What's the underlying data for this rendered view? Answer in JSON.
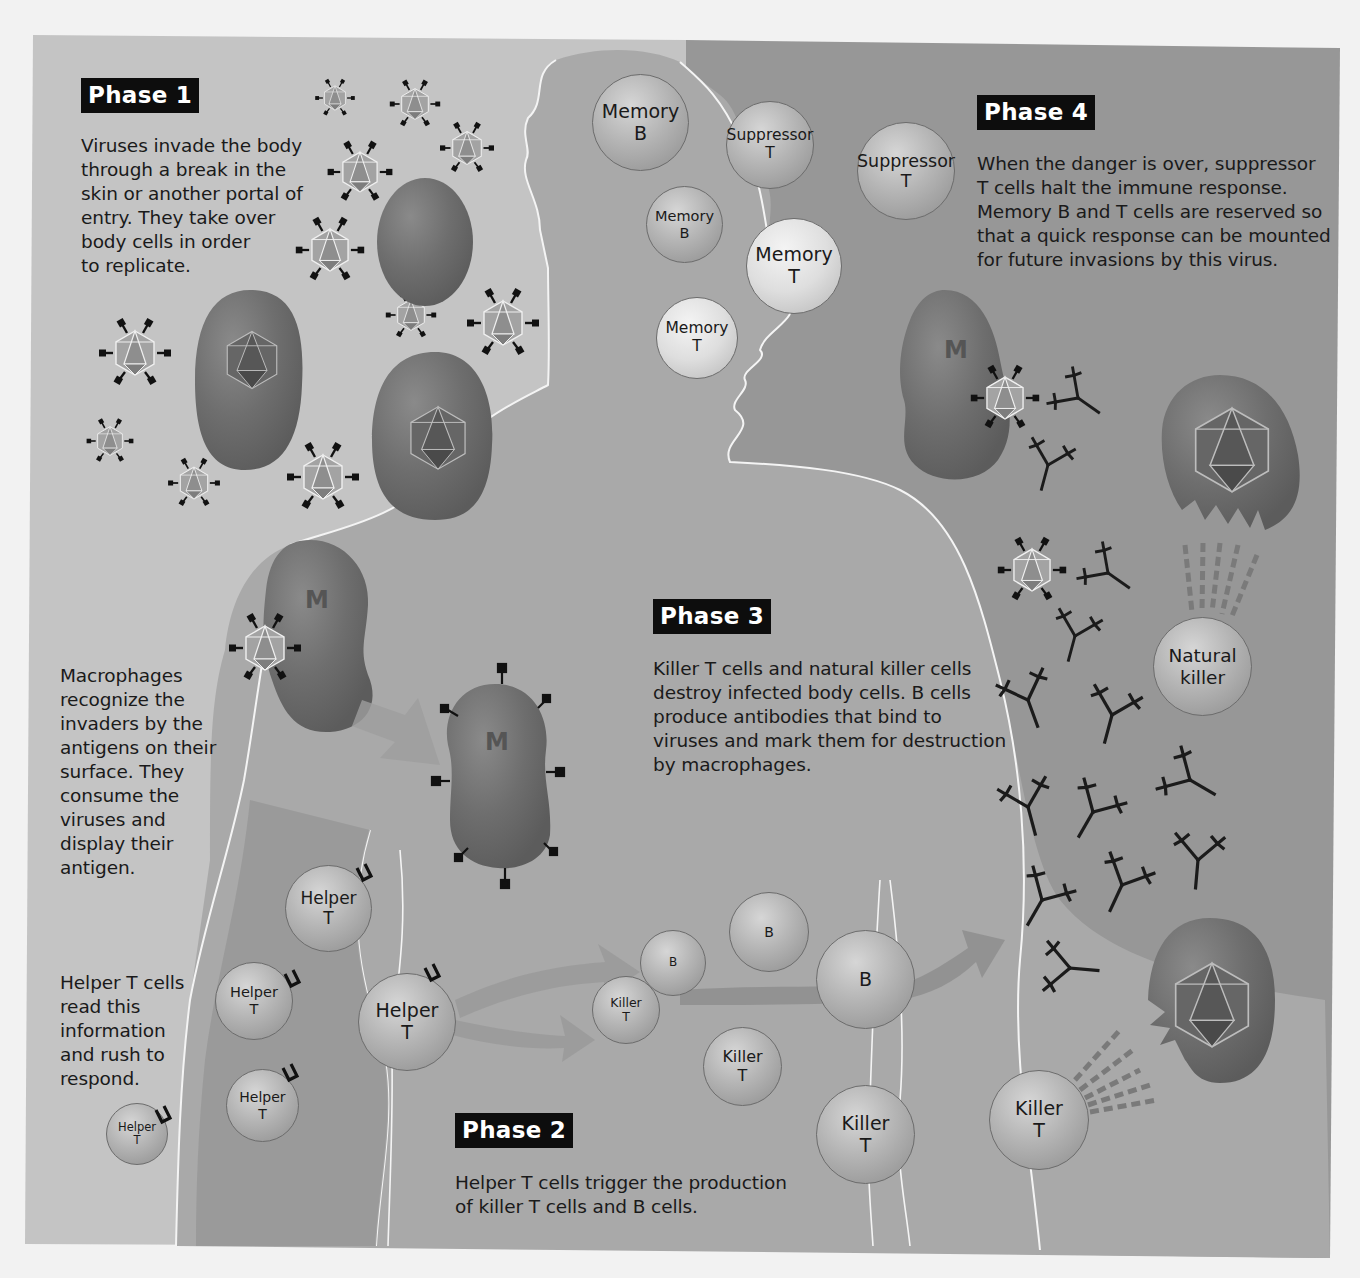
{
  "figure": {
    "colors": {
      "page_background": "#f2f2f2",
      "left_panel": "#c4c4c4",
      "right_panel": "#979797",
      "body_silhouette": "#a9a9a9",
      "body_outline": "#f4f4f4",
      "macrophage": "#6d6d6d",
      "infected_cell": "#707070",
      "phase_label_bg": "#0d0d0d",
      "phase_label_text": "#ffffff",
      "antibody": "#1a1a1a"
    }
  },
  "phases": [
    {
      "id": "phase1",
      "label": "Phase 1",
      "description": "Viruses invade the body\nthrough a break in the\nskin or another portal of\nentry. They take over\nbody cells in order\nto replicate."
    },
    {
      "id": "phase1b",
      "label": "",
      "description": "Macrophages\nrecognize the\ninvaders by the\nantigens on their\nsurface. They\nconsume the\nviruses and\ndisplay their\nantigen."
    },
    {
      "id": "phase1c",
      "label": "",
      "description": "Helper T cells\nread this\ninformation\nand rush to\nrespond."
    },
    {
      "id": "phase2",
      "label": "Phase 2",
      "description": "Helper T cells trigger the production\nof killer T cells and B cells."
    },
    {
      "id": "phase3",
      "label": "Phase 3",
      "description": "Killer T cells and natural killer cells\ndestroy infected body cells. B cells\nproduce antibodies that bind to\nviruses and mark them for destruction\nby macrophages."
    },
    {
      "id": "phase4",
      "label": "Phase 4",
      "description": "When the danger is over, suppressor\nT cells halt the immune response.\nMemory B and T cells are reserved so\nthat a quick response can be mounted\nfor future invasions by this virus."
    }
  ],
  "cells": {
    "memory_b_1": "Memory\nB",
    "memory_b_2": "Memory\nB",
    "memory_t_1": "Memory\nT",
    "memory_t_2": "Memory\nT",
    "suppressor_t_1": "Suppressor\nT",
    "suppressor_t_2": "Suppressor\nT",
    "helper_t_1": "Helper\nT",
    "helper_t_2": "Helper\nT",
    "helper_t_3": "Helper\nT",
    "helper_t_4": "Helper\nT",
    "helper_t_5": "Helper\nT",
    "b_1": "B",
    "b_2": "B",
    "b_3": "B",
    "killer_t_1": "Killer\nT",
    "killer_t_2": "Killer\nT",
    "killer_t_3": "Killer\nT",
    "killer_t_4": "Killer\nT",
    "natural_killer": "Natural\nkiller"
  },
  "macrophage_label": "M"
}
